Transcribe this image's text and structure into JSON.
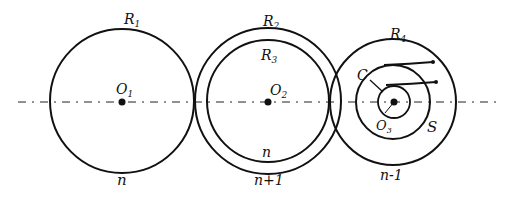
{
  "diagram": {
    "axis": {
      "style": "dash-dot"
    },
    "gears": [
      {
        "id": "gear1",
        "center_label": "O",
        "center_sub": "1",
        "outer_label": "R",
        "outer_sub": "1",
        "bottom_label": "n"
      },
      {
        "id": "gear2",
        "center_label": "O",
        "center_sub": "2",
        "outer_label": "R",
        "outer_sub": "2",
        "inner_label": "R",
        "inner_sub": "3",
        "inner_bottom_label": "n",
        "bottom_label": "n+1"
      },
      {
        "id": "gear3",
        "center_label": "O",
        "center_sub": "3",
        "outer_label": "R",
        "outer_sub": "4",
        "bottom_label": "n-1",
        "extra_labels": {
          "c": "C",
          "s": "S"
        }
      }
    ]
  }
}
